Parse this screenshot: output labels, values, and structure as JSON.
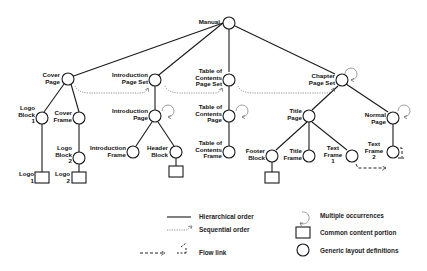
{
  "colors": {
    "line": "#1a1a1a",
    "dotted": "#777777",
    "background": "#ffffff"
  },
  "nodes": {
    "manual": {
      "label": "Manual"
    },
    "cover_page": {
      "label": "Cover\nPage"
    },
    "intro_page_set": {
      "label": "Introduction\nPage Set"
    },
    "toc_page_set": {
      "label": "Table of\nContents\nPage Set"
    },
    "chapter_page_set": {
      "label": "Chapter\nPage Set"
    },
    "logo_block_1": {
      "label": "Logo\nBlock\n1"
    },
    "cover_frame": {
      "label": "Cover\nFrame"
    },
    "logo_block_2": {
      "label": "Logo\nBlock\n2"
    },
    "logo_1": {
      "label": "Logo\n1"
    },
    "logo_2": {
      "label": "Logo\n2"
    },
    "intro_page": {
      "label": "Introduction\nPage"
    },
    "intro_frame": {
      "label": "Introduction\nFrame"
    },
    "header_block": {
      "label": "Header\nBlock"
    },
    "toc_page": {
      "label": "Table of\nContents\nPage"
    },
    "toc_frame": {
      "label": "Table of\nContents\nFrame"
    },
    "title_page": {
      "label": "Title\nPage"
    },
    "footer_block": {
      "label": "Footer\nBlock"
    },
    "title_frame": {
      "label": "Title\nFrame"
    },
    "text_frame_1": {
      "label": "Text\nFrame\n1"
    },
    "normal_page": {
      "label": "Normal\nPage"
    },
    "text_frame_2": {
      "label": "Text\nFrame\n2"
    }
  },
  "legend": {
    "hierarchical": "Hierarchical order",
    "sequential": "Sequential order",
    "flow": "Flow link",
    "multiple": "Multiple occurrences",
    "common": "Common content portion",
    "generic": "Generic layout definitions"
  }
}
